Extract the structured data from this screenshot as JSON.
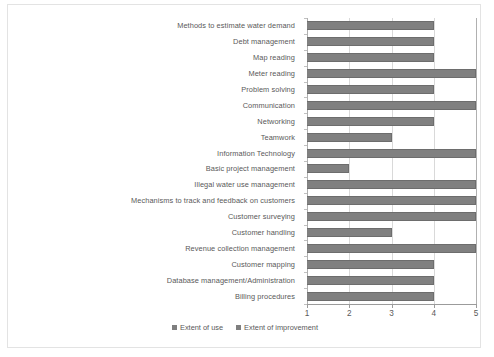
{
  "chart_data": {
    "type": "bar",
    "orientation": "horizontal",
    "title": "",
    "subtitle": "",
    "xlabel": "",
    "ylabel": "",
    "xlim": [
      1,
      5
    ],
    "xticks": [
      1,
      2,
      3,
      4,
      5
    ],
    "xtick_labels": [
      "1",
      "2",
      "3",
      "4",
      "5"
    ],
    "grid": true,
    "grid_axis": "x",
    "legend_position": "bottom",
    "bar_color": "#808080",
    "bar_edge_color": "#6d6d6d",
    "gridline_color": "#d9d9d9",
    "text_color": "#595959",
    "categories": [
      "Methods to estimate water demand",
      "Debt management",
      "Map reading",
      "Meter reading",
      "Problem solving",
      "Communication",
      "Networking",
      "Teamwork",
      "Information Technology",
      "Basic project management",
      "Illegal water use management",
      "Mechanisms to track and feedback on customers",
      "Customer surveying",
      "Customer handling",
      "Revenue collection management",
      "Customer mapping",
      "Database management/Administration",
      "Billing procedures"
    ],
    "values": [
      4,
      4,
      4,
      5,
      4,
      5,
      4,
      3,
      5,
      2,
      5,
      5,
      5,
      3,
      5,
      4,
      4,
      4
    ],
    "series": [
      {
        "name": "Extent of use",
        "values": [
          4,
          4,
          4,
          5,
          4,
          5,
          4,
          3,
          5,
          2,
          5,
          5,
          5,
          3,
          5,
          4,
          4,
          4
        ]
      }
    ],
    "legend": [
      {
        "label": "Extent of use",
        "color": "#7f7f7f"
      },
      {
        "label": "Extent of improvement",
        "color": "#7f7f7f"
      }
    ]
  }
}
